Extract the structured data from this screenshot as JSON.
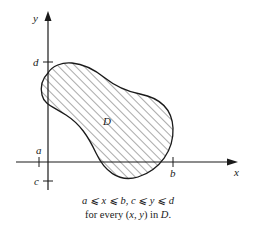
{
  "figure": {
    "axes": {
      "x_label": "x",
      "y_label": "y",
      "x_ticks": [
        {
          "label": "a",
          "position": "left, just before y-axis"
        },
        {
          "label": "b",
          "position": "right edge of region"
        }
      ],
      "y_ticks": [
        {
          "label": "d",
          "position": "top of region"
        },
        {
          "label": "c",
          "position": "bottom of region"
        }
      ]
    },
    "region": {
      "label": "D",
      "fill": "diagonal hatching",
      "stroke_color": "#1a1a1a"
    },
    "caption": {
      "line1": "a ⩽ x ⩽ b, c ⩽ y ⩽ d",
      "line2_prefix": "for every (",
      "line2_xy": "x, y",
      "line2_mid": ") in ",
      "line2_D": "D",
      "line2_suffix": "."
    }
  },
  "colors": {
    "ink": "#1a1a1a",
    "background": "#ffffff"
  }
}
